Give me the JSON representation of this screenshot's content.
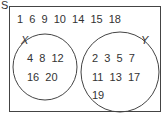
{
  "venn": {
    "universal_label": "S",
    "outside": "1  6  9  10  14  15  18",
    "set_x": {
      "label": "X",
      "row1": "4  8  12",
      "row2": "16  20"
    },
    "set_y": {
      "label": "Y",
      "row1": "2  3  5  7",
      "row2": "11  13  17",
      "row3": "19"
    }
  }
}
